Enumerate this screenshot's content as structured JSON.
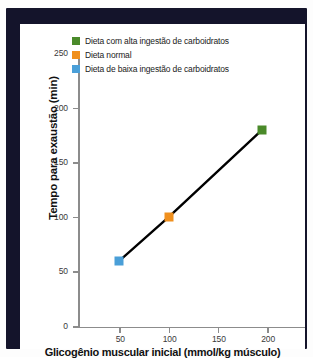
{
  "figure": {
    "frame_color": "#14142b",
    "canvas_color": "#ffffff"
  },
  "legend": {
    "position": "upper-left-inside",
    "items": [
      {
        "label": "Dieta com alta ingestão de carboidratos",
        "color": "#4a8a2a"
      },
      {
        "label": "Dieta normal",
        "color": "#f0901e"
      },
      {
        "label": "Dieta de baixa ingestão de carboidratos",
        "color": "#4a9fd8"
      }
    ]
  },
  "axes": {
    "x": {
      "label": "Glicogênio muscular inicial (mmol/kg músculo)",
      "ticks": [
        "50",
        "100",
        "150",
        "200"
      ],
      "tick_values": [
        50,
        100,
        150,
        200
      ],
      "range": [
        0,
        230
      ]
    },
    "y": {
      "label": "Tempo para exaustão (min)",
      "ticks": [
        "0",
        "50",
        "100",
        "150",
        "200",
        "250"
      ],
      "tick_values": [
        0,
        50,
        100,
        150,
        200,
        250
      ],
      "range": [
        0,
        250
      ]
    }
  },
  "chart_data": {
    "type": "line",
    "title": "",
    "subtitle": "",
    "xlabel": "Glicogênio muscular inicial (mmol/kg músculo)",
    "ylabel": "Tempo para exaustão (min)",
    "xlim": [
      0,
      230
    ],
    "ylim": [
      0,
      250
    ],
    "grid": false,
    "legend_position": "upper left",
    "line_color": "#000000",
    "line_width": 2.4,
    "series": [
      {
        "name": "Tempo para exaustão",
        "x": [
          50,
          100,
          195
        ],
        "y": [
          60,
          100,
          180
        ],
        "points": [
          {
            "x": 50,
            "y": 60,
            "color": "#4a9fd8",
            "label": "Dieta de baixa ingestão de carboidratos"
          },
          {
            "x": 100,
            "y": 100,
            "color": "#f0901e",
            "label": "Dieta normal"
          },
          {
            "x": 195,
            "y": 180,
            "color": "#4a8a2a",
            "label": "Dieta com alta ingestão de carboidratos"
          }
        ]
      }
    ]
  }
}
